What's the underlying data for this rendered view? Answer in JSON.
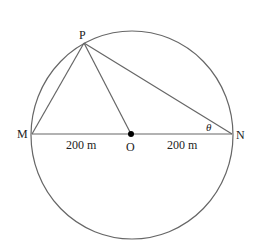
{
  "diagram": {
    "type": "circle-geometry",
    "points": {
      "P": {
        "label": "P",
        "x": 84,
        "y": 43
      },
      "M": {
        "label": "M",
        "x": 32,
        "y": 134
      },
      "O": {
        "label": "O",
        "x": 131,
        "y": 134
      },
      "N": {
        "label": "N",
        "x": 232,
        "y": 134
      }
    },
    "circle": {
      "center": "O",
      "cx": 132,
      "cy": 135,
      "rx": 101,
      "ry": 104
    },
    "segments": [
      "PM",
      "PO",
      "PN",
      "MN"
    ],
    "labels": {
      "P": "P",
      "M": "M",
      "O": "O",
      "N": "N",
      "MO_length": "200 m",
      "ON_length": "200 m",
      "angle_at_N": "θ"
    },
    "colors": {
      "stroke": "#555555",
      "text": "#222222",
      "dot": "#000000"
    }
  }
}
